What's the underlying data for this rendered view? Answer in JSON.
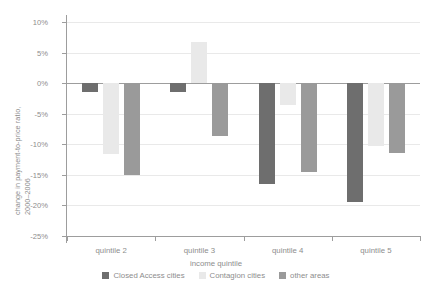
{
  "chart_data": {
    "type": "bar",
    "title": "",
    "xlabel": "income quintile",
    "ylabel_line1": "change in payment-to-price ratio,",
    "ylabel_line2": "2000–2006",
    "categories": [
      "quintile 2",
      "quintile 3",
      "quintile 4",
      "quintile 5"
    ],
    "series": [
      {
        "name": "Closed Access cities",
        "color": "#6e6e6e",
        "values": [
          -1.5,
          -1.5,
          -16.5,
          -19.5
        ]
      },
      {
        "name": "Contagion cities",
        "color": "#e9e9e9",
        "values": [
          -11.6,
          6.8,
          -3.5,
          -10.2
        ]
      },
      {
        "name": "other areas",
        "color": "#9a9a9a",
        "values": [
          -15.0,
          -8.7,
          -14.5,
          -11.5
        ]
      }
    ],
    "ylim": [
      -25,
      10
    ],
    "yticks": [
      10,
      5,
      0,
      -5,
      -10,
      -15,
      -20,
      -25
    ],
    "ytick_labels": [
      "10%",
      "5%",
      "0%",
      "-5%",
      "-10%",
      "-15%",
      "-20%",
      "-25%"
    ],
    "grid": true,
    "legend_position": "bottom",
    "zero_line": 0
  }
}
